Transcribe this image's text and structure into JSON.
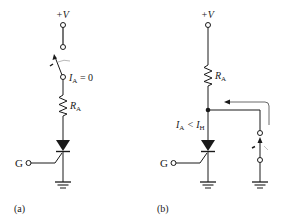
{
  "figure": {
    "panel_a": {
      "caption": "(a)",
      "supply_label": "+V",
      "current_label_main": "I",
      "current_label_sub": "A",
      "current_label_rest": " = 0",
      "resistor_label_main": "R",
      "resistor_label_sub": "A",
      "gate_label": "G"
    },
    "panel_b": {
      "caption": "(b)",
      "supply_label": "+V",
      "resistor_label_main": "R",
      "resistor_label_sub": "A",
      "current_label_main": "I",
      "current_label_sub": "A",
      "current_label_mid": " < I",
      "current_label_sub2": "H",
      "gate_label": "G"
    },
    "colors": {
      "stroke": "#1a1a1a",
      "background": "#ffffff"
    }
  }
}
